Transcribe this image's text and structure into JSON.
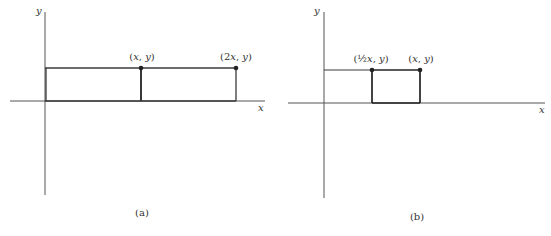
{
  "panels": [
    {
      "id": "a",
      "caption": "(a)",
      "axis_x_label": "x",
      "axis_y_label": "y",
      "points": [
        {
          "label_pre": "(",
          "label_var": "x",
          "label_post": ", y)",
          "label": "(x, y)"
        },
        {
          "label_pre": "(2",
          "label_var": "x",
          "label_post": ", y)",
          "label": "(2x, y)"
        }
      ]
    },
    {
      "id": "b",
      "caption": "(b)",
      "axis_x_label": "x",
      "axis_y_label": "y",
      "points": [
        {
          "label_pre": "(½",
          "label_var": "x",
          "label_post": ", y)",
          "label": "(½x, y)"
        },
        {
          "label_pre": "(",
          "label_var": "x",
          "label_post": ", y)",
          "label": "(x, y)"
        }
      ]
    }
  ],
  "colors": {
    "line": "#3a3a3a",
    "axis": "#555555",
    "text": "#333333"
  }
}
